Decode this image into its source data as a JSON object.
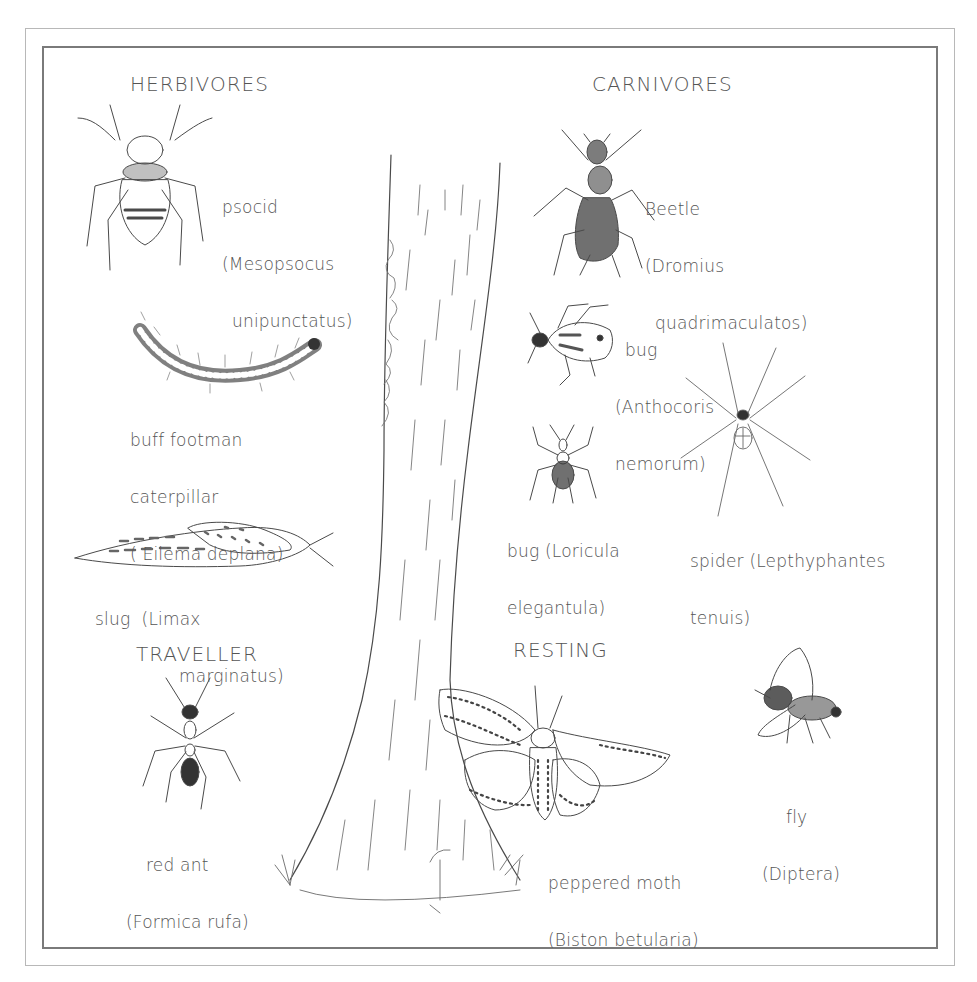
{
  "diagram": {
    "type": "illustration",
    "colors": {
      "ink": "#4a4a4a",
      "border_outer": "#b8b8b8",
      "border_inner": "#7a7a7a",
      "background": "#ffffff"
    },
    "groups": {
      "herbivores": "HERBIVORES",
      "carnivores": "CARNIVORES",
      "traveller": "TRAVELLER",
      "resting": "RESTING"
    },
    "specimens": {
      "psocid": {
        "common": "psocid",
        "latin_l1": "(Mesopsocus",
        "latin_l2": "unipunctatus)",
        "group": "HERBIVORES"
      },
      "caterpillar": {
        "common": "buff footman",
        "common_l2": "caterpillar",
        "latin": "( Eilema deplana)",
        "group": "HERBIVORES"
      },
      "slug": {
        "common": "slug  (Limax",
        "latin_l2": "marginatus)",
        "group": "HERBIVORES"
      },
      "beetle": {
        "common": "Beetle",
        "latin_l1": "(Dromius",
        "latin_l2": "quadrimaculatos)",
        "group": "CARNIVORES"
      },
      "anthocoris": {
        "common": "bug",
        "latin_l1": "(Anthocoris",
        "latin_l2": "nemorum)",
        "group": "CARNIVORES"
      },
      "loricula": {
        "common": "bug (Loricula",
        "latin_l2": "elegantula)",
        "group": "CARNIVORES"
      },
      "spider": {
        "common": "spider (Lepthyphantes",
        "latin_l2": "tenuis)",
        "group": "CARNIVORES"
      },
      "ant": {
        "common": "red ant",
        "latin": "(Formica rufa)",
        "group": "TRAVELLER"
      },
      "moth": {
        "common": "peppered moth",
        "latin": "(Biston betularia)",
        "group": "RESTING"
      },
      "fly": {
        "common": "fly",
        "latin": "(Diptera)",
        "group": "RESTING"
      }
    }
  }
}
